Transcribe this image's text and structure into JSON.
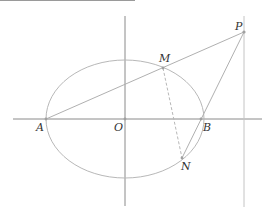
{
  "diagram": {
    "type": "geometry-figure",
    "colors": {
      "axis": "#8a8a8a",
      "curve": "#b8b8b8",
      "line": "#b0b0b0",
      "label": "#333333",
      "point": "#a0a0a0"
    },
    "labels": {
      "A": "A",
      "O": "O",
      "B": "B",
      "M": "M",
      "N": "N",
      "P": "P"
    },
    "points": {
      "O": [
        125,
        119
      ],
      "A": [
        46,
        119
      ],
      "B": [
        201,
        119
      ],
      "M": [
        163,
        68
      ],
      "N": [
        182,
        158
      ],
      "P": [
        244,
        32
      ]
    },
    "ellipse": {
      "cx": 125,
      "cy": 119,
      "rx": 79,
      "ry": 59
    },
    "segments": [
      {
        "from": "A",
        "to": "P",
        "style": "solid"
      },
      {
        "from": "P",
        "to": "N",
        "style": "solid"
      },
      {
        "from": "M",
        "to": "N",
        "style": "dashed"
      }
    ]
  }
}
